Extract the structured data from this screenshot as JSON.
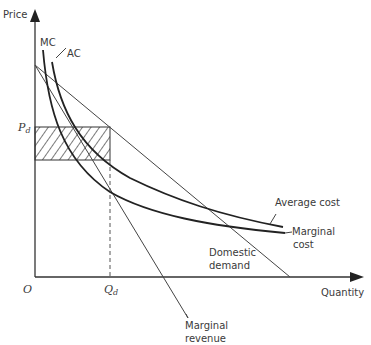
{
  "diagram": {
    "axes": {
      "y_label": "Price",
      "x_label": "Quantity",
      "origin_label": "O"
    },
    "markers": {
      "price_label_main": "P",
      "price_label_sub": "d",
      "quantity_label_main": "Q",
      "quantity_label_sub": "d"
    },
    "curves": {
      "mc_short": "MC",
      "ac_short": "AC",
      "average_cost": "Average cost",
      "marginal_cost_line1": "Marginal",
      "marginal_cost_line2": "cost",
      "domestic_demand_line1": "Domestic",
      "domestic_demand_line2": "demand",
      "marginal_revenue_line1": "Marginal",
      "marginal_revenue_line2": "revenue"
    },
    "shaded_region": "hatched-profit-rectangle"
  }
}
